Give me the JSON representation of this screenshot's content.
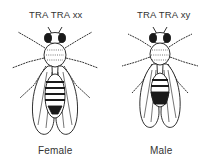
{
  "figure": {
    "panels": [
      {
        "genotype": "TRA TRA xx",
        "caption": "Female"
      },
      {
        "genotype": "TRA TRA xy",
        "caption": "Male"
      }
    ]
  },
  "colors": {
    "ink": "#1a1a1a",
    "background": "#ffffff"
  }
}
